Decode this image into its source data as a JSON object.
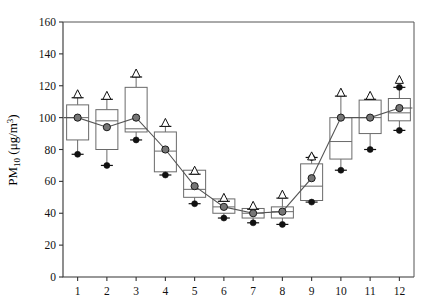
{
  "chart_data": {
    "type": "box",
    "title": "",
    "subtitle": "",
    "xlabel": "",
    "ylabel": "PM10 (ug/m3)",
    "ylabel_parts": {
      "base": "PM",
      "subscript": "10",
      "units_open": "  (μg/m",
      "units_sup": "3",
      "units_close": ")"
    },
    "categories": [
      "1",
      "2",
      "3",
      "4",
      "5",
      "6",
      "7",
      "8",
      "9",
      "10",
      "11",
      "12"
    ],
    "xlim": [
      0.5,
      12.5
    ],
    "ylim": [
      0,
      160
    ],
    "yticks": [
      0,
      20,
      40,
      60,
      80,
      100,
      120,
      140,
      160
    ],
    "ytick_labels": [
      "0",
      "20",
      "40",
      "60",
      "80",
      "100",
      "120",
      "140",
      "160"
    ],
    "xticks": [
      1,
      2,
      3,
      4,
      5,
      6,
      7,
      8,
      9,
      10,
      11,
      12
    ],
    "grid": false,
    "legend": null,
    "legend_position": "none",
    "series": [
      {
        "name": "Monthly mean PM10",
        "type": "line-with-markers",
        "marker": "filled-grey-circle",
        "values": [
          100,
          94,
          100,
          80,
          57,
          44,
          40,
          41,
          62,
          100,
          100,
          106
        ]
      },
      {
        "name": "Box distribution per month",
        "type": "box",
        "boxes": [
          {
            "category": "1",
            "triangle": 115,
            "upper_dot": null,
            "box_top": 108,
            "median": 100,
            "box_bottom": 86,
            "lower_dot": 77
          },
          {
            "category": "2",
            "triangle": 114,
            "upper_dot": null,
            "box_top": 105,
            "median": 98,
            "box_bottom": 80,
            "lower_dot": 70
          },
          {
            "category": "3",
            "triangle": 128,
            "upper_dot": null,
            "box_top": 119,
            "median": 93,
            "box_bottom": 91,
            "lower_dot": 86
          },
          {
            "category": "4",
            "triangle": 97,
            "upper_dot": null,
            "box_top": 91,
            "median": 79,
            "box_bottom": 66,
            "lower_dot": 64
          },
          {
            "category": "5",
            "triangle": 67,
            "upper_dot": null,
            "box_top": 67,
            "median": 55,
            "box_bottom": 50,
            "lower_dot": 46
          },
          {
            "category": "6",
            "triangle": 50,
            "upper_dot": null,
            "box_top": 49,
            "median": 44,
            "box_bottom": 40,
            "lower_dot": 37
          },
          {
            "category": "7",
            "triangle": 45,
            "upper_dot": null,
            "box_top": 43,
            "median": 40,
            "box_bottom": 37,
            "lower_dot": 34
          },
          {
            "category": "8",
            "triangle": 52,
            "upper_dot": null,
            "box_top": 44,
            "median": 41,
            "box_bottom": 37,
            "lower_dot": 33
          },
          {
            "category": "9",
            "triangle": 76,
            "upper_dot": 75,
            "box_top": 71,
            "median": 57,
            "box_bottom": 48,
            "lower_dot": 47
          },
          {
            "category": "10",
            "triangle": 116,
            "upper_dot": null,
            "box_top": 100,
            "median": 85,
            "box_bottom": 74,
            "lower_dot": 67
          },
          {
            "category": "11",
            "triangle": 114,
            "upper_dot": null,
            "box_top": 111,
            "median": 100,
            "box_bottom": 90,
            "lower_dot": 80
          },
          {
            "category": "12",
            "triangle": 124,
            "upper_dot": 119,
            "box_top": 112,
            "median": 103,
            "box_bottom": 98,
            "lower_dot": 92
          }
        ]
      }
    ],
    "colors": {
      "axis": "#333333",
      "frame": "#555555",
      "box_stroke": "#6a6a6a",
      "box_fill": "#ffffff",
      "mean_marker": "#767676",
      "extreme_marker": "#111111",
      "triangle_fill": "#ffffff",
      "line": "#555555"
    }
  }
}
